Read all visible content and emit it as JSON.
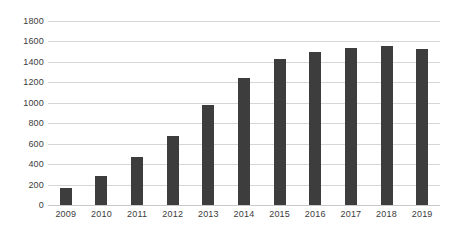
{
  "chart_data": {
    "type": "bar",
    "title": "",
    "subtitle": "",
    "xlabel": "",
    "ylabel": "",
    "categories": [
      "2009",
      "2010",
      "2011",
      "2012",
      "2013",
      "2014",
      "2015",
      "2016",
      "2017",
      "2018",
      "2019"
    ],
    "values": [
      165,
      285,
      465,
      675,
      975,
      1245,
      1425,
      1500,
      1540,
      1560,
      1525
    ],
    "ylim": [
      0,
      1800
    ],
    "y_ticks": [
      0,
      200,
      400,
      600,
      800,
      1000,
      1200,
      1400,
      1600,
      1800
    ],
    "y_tick_labels": [
      "0",
      "200",
      "400",
      "600",
      "800",
      "1000",
      "1200",
      "1400",
      "1600",
      "1800"
    ],
    "grid": "horizontal",
    "legend": "none",
    "series": [
      {
        "name": "",
        "values": [
          165,
          285,
          465,
          675,
          975,
          1245,
          1425,
          1500,
          1540,
          1560,
          1525
        ]
      }
    ],
    "colors": {
      "bar": "#3d3d3d",
      "gridline": "#d6d6d6",
      "axis": "#c9c9c9",
      "tick_label": "#3c3c3c",
      "background": "#ffffff"
    }
  }
}
